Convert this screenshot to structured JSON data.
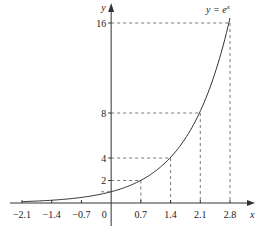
{
  "chart_data": {
    "type": "line",
    "title": "",
    "function_label": "y = e^x",
    "function_label_base": "y = e",
    "function_label_exp": "x",
    "xlabel": "x",
    "ylabel": "y",
    "xlim": [
      -2.1,
      2.8
    ],
    "ylim": [
      0,
      16
    ],
    "x_ticks": [
      -2.1,
      -1.4,
      -0.7,
      0,
      0.7,
      1.4,
      2.1,
      2.8
    ],
    "x_tick_labels": [
      "−2.1",
      "−1.4",
      "−0.7",
      "0",
      "0.7",
      "1.4",
      "2.1",
      "2.8"
    ],
    "y_ticks": [
      2,
      4,
      8,
      16
    ],
    "y_tick_labels": [
      "2",
      "4",
      "8",
      "16"
    ],
    "guide_points": [
      {
        "x": 0,
        "y": 1
      },
      {
        "x": 0.7,
        "y": 2
      },
      {
        "x": 1.4,
        "y": 4
      },
      {
        "x": 2.1,
        "y": 8
      },
      {
        "x": 2.8,
        "y": 16
      }
    ],
    "series": [
      {
        "name": "y = e^x",
        "x_range": [
          -2.1,
          2.8
        ],
        "function": "exp"
      }
    ],
    "grid": false,
    "legend": "none"
  }
}
